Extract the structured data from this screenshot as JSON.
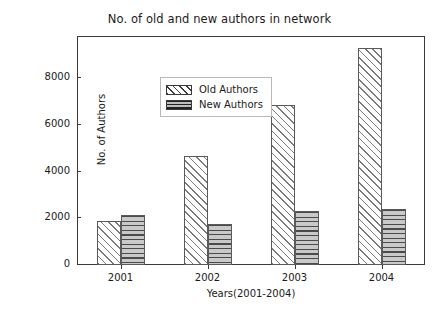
{
  "chart_data": {
    "type": "bar",
    "title": "No. of old and new authors in network",
    "xlabel": "Years(2001-2004)",
    "ylabel": "No. of Authors",
    "categories": [
      "2001",
      "2002",
      "2003",
      "2004"
    ],
    "series": [
      {
        "name": "Old Authors",
        "values": [
          1900,
          4650,
          6850,
          9300
        ],
        "hatch": "diagonal",
        "facecolor": "#ffffff",
        "edgecolor": "#5a5a5a"
      },
      {
        "name": "New Authors",
        "values": [
          2150,
          1750,
          2300,
          2400
        ],
        "hatch": "horizontal",
        "facecolor": "#c9c9c9",
        "edgecolor": "#5a5a5a"
      }
    ],
    "ylim": [
      0,
      9800
    ],
    "yticks": [
      0,
      2000,
      4000,
      6000,
      8000
    ],
    "ytick_labels": [
      "0",
      "2000",
      "4000",
      "6000",
      "8000"
    ],
    "grid": false,
    "legend_position": "upper left"
  },
  "legend": {
    "items": [
      {
        "label": "Old Authors",
        "swatch": "diagonal-hatch-swatch"
      },
      {
        "label": "New Authors",
        "swatch": "horizontal-hatch-swatch"
      }
    ]
  }
}
